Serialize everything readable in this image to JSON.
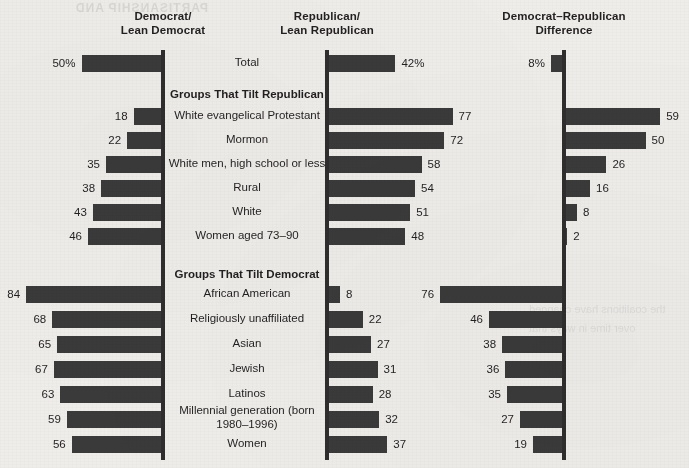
{
  "bleed": {
    "top_ghost": "PARTISANSHIP AND",
    "side_ghost": "the coalitions\nhave changed\nover time in\nways that"
  },
  "chart_data": {
    "type": "bar",
    "title": "",
    "columns": [
      {
        "key": "dem",
        "label": "Democrat/\nLean Democrat",
        "direction": "left",
        "axis_x": 163
      },
      {
        "key": "rep",
        "label": "Republican/\nLean Republican",
        "direction": "right",
        "axis_x": 327
      },
      {
        "key": "diff",
        "label": "Democrat–Republican\nDifference",
        "direction": "mixed",
        "axis_x": 564
      }
    ],
    "px_per_unit": 1.63,
    "bar_height": 17,
    "value_suffix_first_row": "%",
    "sections": [
      {
        "heading": "",
        "rows": [
          {
            "label": "Total",
            "dem": 50,
            "rep": 42,
            "diff": 8,
            "diff_direction": "left",
            "dem_display": "50%",
            "rep_display": "42%",
            "diff_display": "8%",
            "y": 55
          }
        ]
      },
      {
        "heading": "Groups That Tilt Republican",
        "heading_y": 88,
        "rows": [
          {
            "label": "White evangelical Protestant",
            "dem": 18,
            "rep": 77,
            "diff": 59,
            "diff_direction": "right",
            "dem_display": "18",
            "rep_display": "77",
            "diff_display": "59",
            "y": 108
          },
          {
            "label": "Mormon",
            "dem": 22,
            "rep": 72,
            "diff": 50,
            "diff_direction": "right",
            "dem_display": "22",
            "rep_display": "72",
            "diff_display": "50",
            "y": 132
          },
          {
            "label": "White men, high school or less",
            "dem": 35,
            "rep": 58,
            "diff": 26,
            "diff_direction": "right",
            "dem_display": "35",
            "rep_display": "58",
            "diff_display": "26",
            "y": 156
          },
          {
            "label": "Rural",
            "dem": 38,
            "rep": 54,
            "diff": 16,
            "diff_direction": "right",
            "dem_display": "38",
            "rep_display": "54",
            "diff_display": "16",
            "y": 180
          },
          {
            "label": "White",
            "dem": 43,
            "rep": 51,
            "diff": 8,
            "diff_direction": "right",
            "dem_display": "43",
            "rep_display": "51",
            "diff_display": "8",
            "y": 204
          },
          {
            "label": "Women aged 73–90",
            "dem": 46,
            "rep": 48,
            "diff": 2,
            "diff_direction": "right",
            "dem_display": "46",
            "rep_display": "48",
            "diff_display": "2",
            "y": 228
          }
        ]
      },
      {
        "heading": "Groups That Tilt Democrat",
        "heading_y": 268,
        "rows": [
          {
            "label": "African American",
            "dem": 84,
            "rep": 8,
            "diff": 76,
            "diff_direction": "left",
            "dem_display": "84",
            "rep_display": "8",
            "diff_display": "76",
            "y": 286
          },
          {
            "label": "Religiously unaffiliated",
            "dem": 68,
            "rep": 22,
            "diff": 46,
            "diff_direction": "left",
            "dem_display": "68",
            "rep_display": "22",
            "diff_display": "46",
            "y": 311
          },
          {
            "label": "Asian",
            "dem": 65,
            "rep": 27,
            "diff": 38,
            "diff_direction": "left",
            "dem_display": "65",
            "rep_display": "27",
            "diff_display": "38",
            "y": 336
          },
          {
            "label": "Jewish",
            "dem": 67,
            "rep": 31,
            "diff": 36,
            "diff_direction": "left",
            "dem_display": "67",
            "rep_display": "31",
            "diff_display": "36",
            "y": 361
          },
          {
            "label": "Latinos",
            "dem": 63,
            "rep": 28,
            "diff": 35,
            "diff_direction": "left",
            "dem_display": "63",
            "rep_display": "28",
            "diff_display": "35",
            "y": 386
          },
          {
            "label": "Millennial generation\n(born 1980–1996)",
            "dem": 59,
            "rep": 32,
            "diff": 27,
            "diff_direction": "left",
            "dem_display": "59",
            "rep_display": "32",
            "diff_display": "27",
            "y": 411,
            "label_two_line": true
          },
          {
            "label": "Women",
            "dem": 56,
            "rep": 37,
            "diff": 19,
            "diff_direction": "left",
            "dem_display": "56",
            "rep_display": "37",
            "diff_display": "19",
            "y": 436
          }
        ]
      }
    ],
    "colors": {
      "bar": "#3b3a3a",
      "axis": "#2f2d2e",
      "background": "#eeedea",
      "text": "#231f20"
    },
    "axis_extents": [
      {
        "key": "dem",
        "top": 50,
        "bottom": 460
      },
      {
        "key": "rep",
        "top": 50,
        "bottom": 460
      },
      {
        "key": "diff",
        "top": 50,
        "bottom": 460
      }
    ]
  }
}
